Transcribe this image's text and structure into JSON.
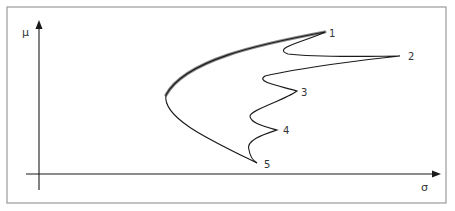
{
  "diagram": {
    "axes": {
      "y_label": "μ",
      "x_label": "σ"
    },
    "points": [
      {
        "label": "1",
        "x": 325,
        "y": 32
      },
      {
        "label": "2",
        "x": 400,
        "y": 56
      },
      {
        "label": "3",
        "x": 297,
        "y": 91
      },
      {
        "label": "4",
        "x": 277,
        "y": 130
      },
      {
        "label": "5",
        "x": 257,
        "y": 163
      }
    ],
    "colors": {
      "frame": "#9a9a9a",
      "axis": "#1a1a1a",
      "curve": "#1a1a1a",
      "frontier_highlight": "#8a8a8a"
    }
  }
}
